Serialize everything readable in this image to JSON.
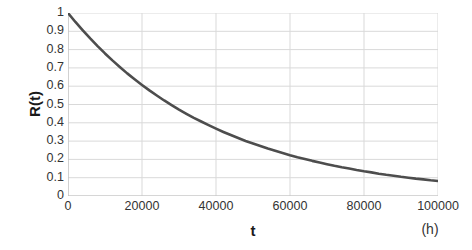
{
  "chart_data": {
    "type": "line",
    "title": "",
    "xlabel": "t",
    "ylabel": "R(t)",
    "x_unit": "(h)",
    "xlim": [
      0,
      100000
    ],
    "ylim": [
      0,
      1
    ],
    "grid": true,
    "legend": false,
    "series_color": "#4d4d4d",
    "gridline_color": "#d9d9d9",
    "axis_color": "#bfbfbf",
    "background_color": "#ffffff",
    "x_ticks": [
      0,
      20000,
      40000,
      60000,
      80000,
      100000
    ],
    "x_tick_labels": [
      "0",
      "20000",
      "40000",
      "60000",
      "80000",
      "100000"
    ],
    "y_ticks": [
      0,
      0.1,
      0.2,
      0.3,
      0.4,
      0.5,
      0.6,
      0.7,
      0.8,
      0.9,
      1
    ],
    "y_tick_labels": [
      "0",
      "0.1",
      "0.2",
      "0.3",
      "0.4",
      "0.5",
      "0.6",
      "0.7",
      "0.8",
      "0.9",
      "1"
    ],
    "series": [
      {
        "name": "R(t)",
        "x": [
          0,
          2000,
          4000,
          6000,
          8000,
          10000,
          12000,
          14000,
          16000,
          18000,
          20000,
          22000,
          24000,
          26000,
          28000,
          30000,
          32000,
          34000,
          36000,
          38000,
          40000,
          42000,
          44000,
          46000,
          48000,
          50000,
          52000,
          54000,
          56000,
          58000,
          60000,
          62000,
          64000,
          66000,
          68000,
          70000,
          72000,
          74000,
          76000,
          78000,
          80000,
          82000,
          84000,
          86000,
          88000,
          90000,
          92000,
          94000,
          96000,
          98000,
          100000
        ],
        "y": [
          1.0,
          0.951,
          0.905,
          0.861,
          0.819,
          0.779,
          0.741,
          0.705,
          0.67,
          0.638,
          0.607,
          0.577,
          0.549,
          0.522,
          0.497,
          0.472,
          0.449,
          0.427,
          0.407,
          0.387,
          0.368,
          0.35,
          0.333,
          0.317,
          0.301,
          0.287,
          0.273,
          0.259,
          0.247,
          0.235,
          0.223,
          0.212,
          0.202,
          0.192,
          0.183,
          0.174,
          0.165,
          0.157,
          0.15,
          0.142,
          0.135,
          0.129,
          0.122,
          0.116,
          0.111,
          0.105,
          0.1,
          0.095,
          0.091,
          0.086,
          0.082
        ]
      }
    ]
  }
}
